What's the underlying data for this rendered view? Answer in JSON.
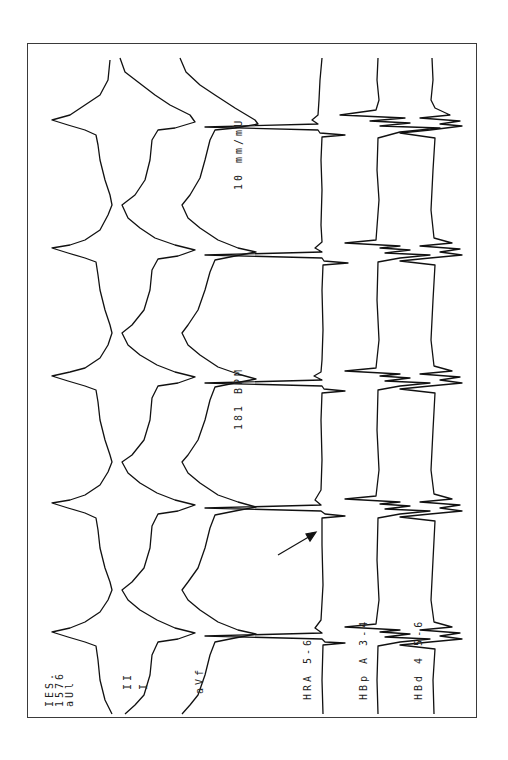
{
  "figure": {
    "header_label": {
      "line1": "IES.",
      "line2": "1576",
      "line3": "aUl"
    },
    "rate_label": "181 BPM",
    "scale_label": "10 mm/mU",
    "channels": [
      {
        "id": "lead-I",
        "label": "I"
      },
      {
        "id": "lead-II",
        "label": "II"
      },
      {
        "id": "lead-aVF",
        "label": "aVf"
      },
      {
        "id": "hra",
        "label": "HRA 5-6"
      },
      {
        "id": "hbp",
        "label": "HBp A 3-4"
      },
      {
        "id": "hbd",
        "label": "HBd 4 5-6"
      }
    ],
    "annotation": {
      "type": "arrow",
      "target": "HRA deflection after spike"
    },
    "colors": {
      "trace": "#111111",
      "frame": "#3a3a3a",
      "background": "#ffffff"
    }
  }
}
